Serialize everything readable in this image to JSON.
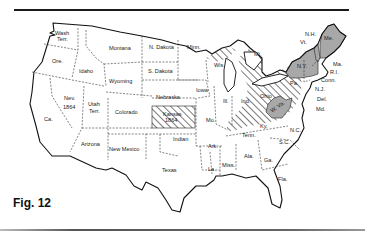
{
  "figure": {
    "caption": "Fig. 12",
    "type": "map"
  },
  "colors": {
    "shaded": "#a8a8a8",
    "hatch": "#333333",
    "outline": "#111111",
    "background": "#ffffff"
  },
  "legend_styles": {
    "shaded_states": [
      "Me.",
      "N.Y.",
      "W. Va."
    ],
    "hatched_states": [
      "Kansas 1864",
      "Mich.",
      "Ohio",
      "Pa.",
      "Ky.",
      "Ind. (east)"
    ]
  },
  "labels": {
    "wash": "Wash",
    "wash2": "Terr.",
    "ore": "Ore.",
    "idaho": "Idaho",
    "montana": "Montana",
    "wyoming": "Wyoming",
    "nev": "Nev.",
    "nev_year": "1864",
    "utah": "Utah",
    "utah2": "Terr.",
    "colorado": "Colorado",
    "ca": "Ca.",
    "arizona": "Arizona",
    "new_mexico": "New Mexico",
    "n_dakota": "N. Dakota",
    "s_dakota": "S. Dakota",
    "nebraska": "Nebraska",
    "kansas": "Kansas",
    "kansas_year": "1864",
    "indian": "Indian",
    "texas": "Texas",
    "minn": "Minn.",
    "iowa": "Iowa",
    "mo": "Mo.",
    "ark": "Ark.",
    "la": "La.",
    "wis": "Wis.",
    "ill": "Ill.",
    "ind": "Ind.",
    "mich": "Mi.",
    "ky": "Ky.",
    "tenn": "Tenn.",
    "miss": "Miss.",
    "ala": "Ala.",
    "ga": "Ga.",
    "fla": "Fla.",
    "sc": "S.C.",
    "nc": "N.C.",
    "wva": "W. Va.",
    "pa": "Pa.",
    "ohio": "Ohio",
    "ny": "N.Y.",
    "nh": "N.H.",
    "vt": "Vt.",
    "me": "Me.",
    "ma": "Ma.",
    "ri": "R.I.",
    "conn": "Conn.",
    "nj": "N.J.",
    "del": "Del.",
    "md": "Md."
  }
}
